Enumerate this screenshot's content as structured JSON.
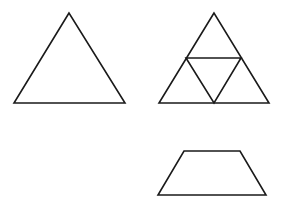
{
  "canvas": {
    "width": 285,
    "height": 208,
    "background": "#ffffff",
    "stroke_color": "#1a1a1a"
  },
  "figures": [
    {
      "id": "triangle",
      "type": "equilateral-triangle",
      "points": "69,13 14,103 125,103"
    },
    {
      "id": "subdivided-triangle",
      "type": "triangle-divided-into-4",
      "outer": "214,13 159,103 269,103",
      "inner": "186,58 241,58 214,103"
    },
    {
      "id": "trapezoid",
      "type": "isosceles-trapezoid",
      "points": "184,151 240,151 266,195 158,195"
    }
  ]
}
